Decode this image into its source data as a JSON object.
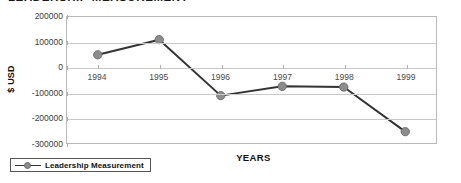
{
  "chart_data": {
    "type": "line",
    "title": "LEADERSHIP  MEASUREMENT",
    "xlabel": "YEARS",
    "ylabel": "$ USD",
    "categories": [
      "1994",
      "1995",
      "1996",
      "1997",
      "1998",
      "1999"
    ],
    "series": [
      {
        "name": "Leadership Measurement",
        "values": [
          50000,
          110000,
          -112000,
          -75000,
          -78000,
          -255000
        ]
      }
    ],
    "ylim": [
      -300000,
      200000
    ],
    "yticks": [
      200000,
      100000,
      0,
      -100000,
      -200000,
      -300000
    ],
    "ytick_labels": [
      "200000",
      "100000",
      "0",
      "-100000",
      "-200000",
      "-300000"
    ],
    "grid": true,
    "legend_position": "below-left",
    "colors": {
      "line": "#333333",
      "marker": "#8c8c8c",
      "marker_edge": "#6e6e6e",
      "gridline": "#c9c9c9",
      "frame": "#b9b9b9",
      "text": "#1a1a1a"
    }
  },
  "legend": {
    "entries": [
      {
        "label": "Leadership Measurement"
      }
    ]
  }
}
